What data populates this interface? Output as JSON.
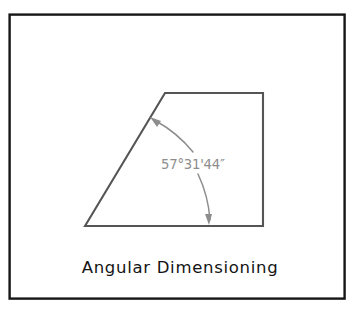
{
  "figure": {
    "caption": "Angular Dimensioning",
    "dimension_label": "57°31'44″",
    "colors": {
      "frame_stroke": "#161616",
      "shape_stroke": "#555555",
      "dimension_stroke": "#8d8d8d",
      "dimension_text": "#8d8d8d",
      "caption_text": "#141414",
      "background": "#ffffff"
    },
    "frame": {
      "x": 9,
      "y": 14,
      "width": 336,
      "height": 285
    },
    "shape": {
      "type": "quadrilateral",
      "points": [
        {
          "name": "bottom-left-vertex",
          "x": 85,
          "y": 226
        },
        {
          "name": "top-left-vertex",
          "x": 165,
          "y": 93
        },
        {
          "name": "top-right-vertex",
          "x": 263,
          "y": 93
        },
        {
          "name": "bottom-right-vertex",
          "x": 263,
          "y": 226
        }
      ]
    },
    "angle_dimension": {
      "vertex": {
        "x": 85,
        "y": 226
      },
      "radius": 127,
      "start_angle_deg": 0,
      "end_angle_deg": 57.53,
      "value_degrees": 57,
      "value_minutes": 31,
      "value_seconds": 44,
      "arrow_upper": {
        "x": 154,
        "y": 119
      },
      "arrow_lower": {
        "x": 210,
        "y": 224
      }
    },
    "caption_position": {
      "x": 180,
      "y": 272
    }
  }
}
